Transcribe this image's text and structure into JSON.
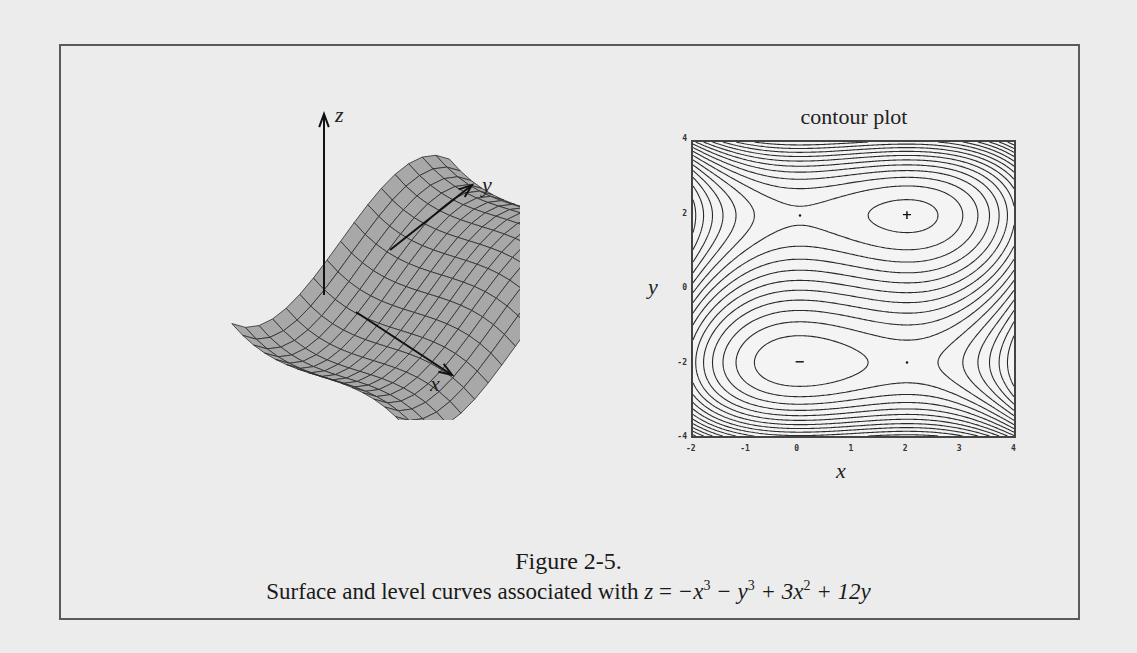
{
  "figure": {
    "number_label": "Figure 2-5.",
    "caption_prefix": "Surface and level curves associated with",
    "equation": {
      "lhs": "z",
      "equals": "=",
      "terms": [
        "−x",
        "3",
        "− y",
        "3",
        "+ 3x",
        "2",
        "+ 12y"
      ]
    },
    "function": "z = -x^3 - y^3 + 3x^2 + 12y"
  },
  "surface_plot": {
    "axis_labels": {
      "x": "x",
      "y": "y",
      "z": "z"
    },
    "colors": {
      "surface": "#a8a8a8",
      "mesh": "#2c2c2c",
      "dark_side": "#5c5c5c",
      "axes": "#111111"
    }
  },
  "contour_plot": {
    "title": "contour plot",
    "xlabel": "x",
    "ylabel": "y",
    "x_ticks": [
      "-2",
      "-1",
      "0",
      "1",
      "2",
      "3",
      "4"
    ],
    "y_ticks": [
      "4",
      "2",
      "0",
      "-2",
      "-4"
    ],
    "critical_points": [
      {
        "x": 0,
        "y": 2,
        "marker": "·",
        "type": "saddle"
      },
      {
        "x": 2,
        "y": 2,
        "marker": "+",
        "type": "local maximum"
      },
      {
        "x": 0,
        "y": -2,
        "marker": "−",
        "type": "local minimum"
      },
      {
        "x": 2,
        "y": -2,
        "marker": "·",
        "type": "saddle"
      }
    ]
  },
  "chart_data": {
    "type": "contour",
    "title": "contour plot",
    "xlabel": "x",
    "ylabel": "y",
    "xlim": [
      -2,
      4
    ],
    "ylim": [
      -4,
      4
    ],
    "x_ticks": [
      -2,
      -1,
      0,
      1,
      2,
      3,
      4
    ],
    "y_ticks": [
      -4,
      -2,
      0,
      2,
      4
    ],
    "function": "z = -x^3 - y^3 + 3x^2 + 12y",
    "annotations": [
      {
        "x": 2,
        "y": 2,
        "label": "+"
      },
      {
        "x": 0,
        "y": -2,
        "label": "−"
      },
      {
        "x": 0,
        "y": 2,
        "label": "·"
      },
      {
        "x": 2,
        "y": -2,
        "label": "·"
      }
    ],
    "grid": false
  }
}
